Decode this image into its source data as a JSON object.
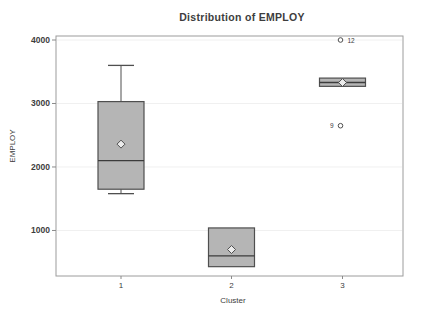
{
  "chart_data": {
    "type": "box",
    "title": "Distribution of EMPLOY",
    "xlabel": "Cluster",
    "ylabel": "EMPLOY",
    "categories": [
      "1",
      "2",
      "3"
    ],
    "yticks": [
      1000,
      2000,
      3000,
      4000
    ],
    "ylim": [
      283,
      4063
    ],
    "grid": true,
    "legend": false,
    "series": [
      {
        "category": "1",
        "whisker_low": 1580,
        "q1": 1650,
        "median": 2100,
        "q3": 3030,
        "whisker_high": 3600,
        "mean": 2360,
        "outliers": []
      },
      {
        "category": "2",
        "whisker_low": 430,
        "q1": 430,
        "median": 600,
        "q3": 1040,
        "whisker_high": 1040,
        "mean": 700,
        "outliers": []
      },
      {
        "category": "3",
        "whisker_low": 3270,
        "q1": 3270,
        "median": 3330,
        "q3": 3400,
        "whisker_high": 3400,
        "mean": 3330,
        "outliers": [
          {
            "value": 4000,
            "label": "12",
            "label_side": "right"
          },
          {
            "value": 2650,
            "label": "9",
            "label_side": "left"
          }
        ]
      }
    ],
    "colors": {
      "background": "#ffffff",
      "box_fill": "#b5b5b5",
      "box_border": "#4f4f4f",
      "median": "#3c3c3c",
      "mean_fill": "#ececec",
      "whisker": "#4f4f4f",
      "outlier_stroke": "#4f4f4f",
      "outlier_fill": "#ffffff",
      "grid": "#f0f0f0",
      "frame": "#9c9c9c",
      "tick": "#8a8a8a",
      "text": "#3d3d3d"
    }
  }
}
